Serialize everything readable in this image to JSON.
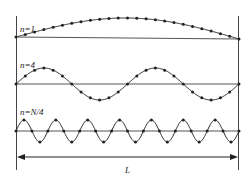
{
  "diagram": {
    "colors": {
      "ink": "#222222",
      "background": "#ffffff"
    },
    "modes": [
      {
        "label": "n=1",
        "half_waves": 1,
        "points": 25,
        "baseline_y": 37,
        "amplitude": 20
      },
      {
        "label": "n=4",
        "half_waves": 4,
        "points": 25,
        "baseline_y": 84,
        "amplitude": 16
      },
      {
        "label": "n=N/4",
        "half_waves": 14,
        "points": 29,
        "baseline_y": 131,
        "amplitude": 11
      }
    ],
    "dimension": {
      "label": "L",
      "arrow": "double-headed"
    },
    "walls": {
      "left_x": 16,
      "right_x": 239,
      "top_y": 16,
      "bottom_y": 170
    }
  }
}
